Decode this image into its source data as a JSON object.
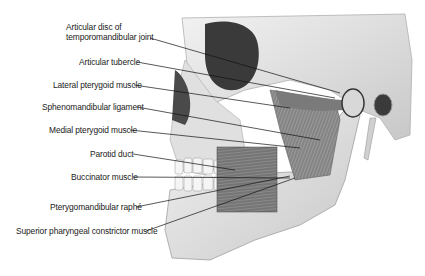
{
  "figure": {
    "labels": [
      {
        "text_line1": "Articular disc of",
        "text_line2": "temporomandibular joint",
        "x": 66,
        "y": 27,
        "line": [
          150,
          38,
          340,
          93
        ]
      },
      {
        "text_line1": "Articular tubercle",
        "text_line2": "",
        "x": 79,
        "y": 58,
        "line": [
          137,
          62,
          335,
          98
        ]
      },
      {
        "text_line1": "Lateral pterygoid muscle",
        "text_line2": "",
        "x": 53,
        "y": 80,
        "line": [
          134,
          85,
          290,
          108
        ]
      },
      {
        "text_line1": "Sphenomandibular ligament",
        "text_line2": "",
        "x": 42,
        "y": 102,
        "line": [
          137,
          107,
          320,
          140
        ]
      },
      {
        "text_line1": "Medial pterygoid muscle",
        "text_line2": "",
        "x": 49,
        "y": 125,
        "line": [
          130,
          130,
          300,
          148
        ]
      },
      {
        "text_line1": "Parotid duct",
        "text_line2": "",
        "x": 90,
        "y": 150,
        "line": [
          133,
          154,
          235,
          170
        ]
      },
      {
        "text_line1": "Buccinator muscle",
        "text_line2": "",
        "x": 71,
        "y": 173,
        "line": [
          133,
          177,
          290,
          178
        ]
      },
      {
        "text_line1": "Pterygomandibular raphé",
        "text_line2": "",
        "x": 50,
        "y": 203,
        "line": [
          136,
          207,
          290,
          176
        ]
      },
      {
        "text_line1": "Superior pharyngeal constrictor muscle",
        "text_line2": "",
        "x": 16,
        "y": 227,
        "line": [
          146,
          231,
          295,
          178
        ]
      }
    ],
    "colors": {
      "bone": "#e6e6e6",
      "bone_shadow": "#9a9a9a",
      "muscle": "#6e6e6e",
      "orbit": "#3a3a3a",
      "leader": "#111111",
      "text": "#1a1a1a"
    }
  }
}
